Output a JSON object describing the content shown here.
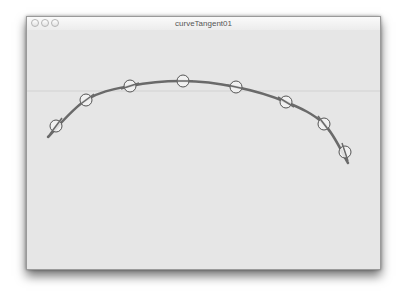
{
  "window": {
    "title": "curveTangent01",
    "buttons": [
      "close",
      "minimize",
      "zoom"
    ]
  },
  "sketch": {
    "background": "#e6e6e6",
    "curve_color": "#6a6a6a",
    "circle_fill": "#f2f2f2",
    "circle_stroke": "#555555",
    "guide_line_y": 91,
    "curve_points": [
      [
        48,
        137
      ],
      [
        86,
        100
      ],
      [
        130,
        86
      ],
      [
        183,
        81
      ],
      [
        236,
        87
      ],
      [
        286,
        102
      ],
      [
        324,
        124
      ],
      [
        348,
        163
      ]
    ],
    "tangent_points": [
      {
        "x": 56,
        "y": 126,
        "dx": 6,
        "dy": -8
      },
      {
        "x": 86,
        "y": 100,
        "dx": 8,
        "dy": -6
      },
      {
        "x": 130,
        "y": 86,
        "dx": 9,
        "dy": -3
      },
      {
        "x": 183,
        "y": 81,
        "dx": 10,
        "dy": 0
      },
      {
        "x": 236,
        "y": 87,
        "dx": 9,
        "dy": 2
      },
      {
        "x": 286,
        "y": 102,
        "dx": 8,
        "dy": 5
      },
      {
        "x": 324,
        "y": 124,
        "dx": 6,
        "dy": 8
      },
      {
        "x": 345,
        "y": 152,
        "dx": 3,
        "dy": 9
      }
    ],
    "circle_radius": 6
  }
}
